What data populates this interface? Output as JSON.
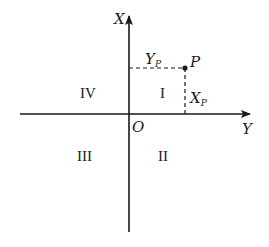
{
  "diagram": {
    "colors": {
      "ink": "#1a1a1a",
      "background": "#ffffff"
    },
    "axes": {
      "vertical": {
        "label": "X"
      },
      "horizontal": {
        "label": "Y"
      },
      "origin": {
        "label": "O"
      }
    },
    "point": {
      "label": "P",
      "projection_horizontal": {
        "label": "Y",
        "subscript": "P"
      },
      "projection_vertical": {
        "label": "X",
        "subscript": "P"
      }
    },
    "quadrants": [
      {
        "id": "I",
        "label": "I"
      },
      {
        "id": "II",
        "label": "II"
      },
      {
        "id": "III",
        "label": "III"
      },
      {
        "id": "IV",
        "label": "IV"
      }
    ]
  }
}
